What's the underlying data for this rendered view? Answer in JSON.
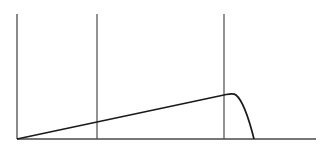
{
  "diagram": {
    "type": "line-diagram",
    "colors": {
      "background": "#ffffff",
      "axis": "#4a4a4a",
      "curve": "#1a1a1a"
    },
    "axes": {
      "y_axis": {
        "x": 17,
        "y_top": 14,
        "y_bottom": 139
      },
      "x_axis": {
        "y": 139,
        "x_start": 17,
        "x_end": 316
      }
    },
    "vertical_markers": [
      {
        "x": 97,
        "y_top": 14,
        "y_bottom": 139
      },
      {
        "x": 224,
        "y_top": 14,
        "y_bottom": 139
      }
    ],
    "curve": {
      "description": "Linear ramp from origin rising to a rounded peak, then steep drop to baseline",
      "points": [
        [
          17,
          139
        ],
        [
          224,
          95
        ],
        [
          232,
          93
        ],
        [
          254,
          139
        ]
      ]
    }
  }
}
